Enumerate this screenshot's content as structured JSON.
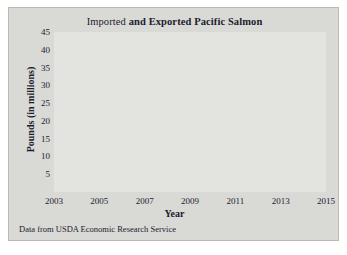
{
  "figure": {
    "caption": "Data from USDA Economic Research Service",
    "background_color": "#d9d9d6",
    "plot_background_color": "#e3e3e0"
  },
  "title_parts": {
    "part1": "Imported ",
    "part2": "and Exported ",
    "part3": "Pacific Salmon"
  },
  "chart_data": {
    "type": "line",
    "title": "Imported and Exported Pacific Salmon",
    "xlabel": "Year",
    "ylabel": "Pounds (in millions)",
    "xlim": [
      2003,
      2015
    ],
    "ylim": [
      0,
      45
    ],
    "xticks": [
      2003,
      2005,
      2007,
      2009,
      2011,
      2013,
      2015
    ],
    "yticks": [
      5,
      10,
      15,
      20,
      25,
      30,
      35,
      40,
      45
    ],
    "grid": true,
    "legend": "none",
    "x": [
      2003,
      2004,
      2005,
      2006,
      2007,
      2008,
      2009,
      2010,
      2011,
      2012,
      2013,
      2014
    ],
    "series": [
      {
        "name": "Imported",
        "color": "#3b3b4d",
        "marker": "circle",
        "values": [
          40,
          32,
          19,
          20,
          16,
          16,
          12,
          19,
          21,
          21,
          24.3,
          14.3
        ]
      },
      {
        "name": "Exported",
        "color": "#6f6f80",
        "marker": "circle",
        "values": [
          21,
          22,
          22,
          20.5,
          18,
          13,
          12,
          19,
          20,
          10.2,
          12.2,
          10.2
        ]
      }
    ]
  }
}
